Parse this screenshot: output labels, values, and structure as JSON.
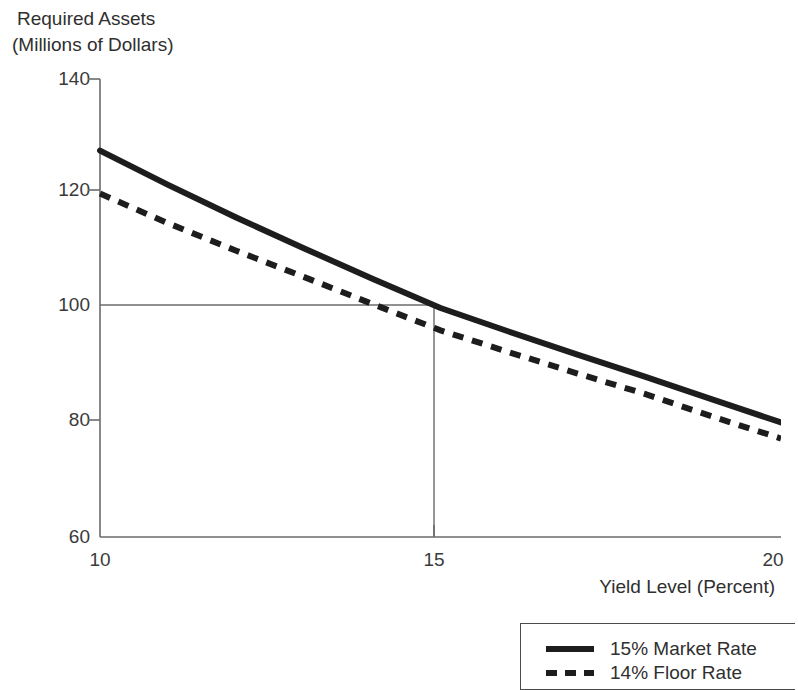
{
  "chart_data": {
    "type": "line",
    "title": "Required Assets (Millions of Dollars)",
    "title_line1": "Required Assets",
    "title_line2": "(Millions of Dollars)",
    "xlabel": "Yield Level (Percent)",
    "ylabel": "Required Assets (Millions of Dollars)",
    "xlim": [
      10,
      20
    ],
    "ylim": [
      60,
      140
    ],
    "xticks": [
      "10",
      "15",
      "20"
    ],
    "yticks": [
      "140",
      "120",
      "100",
      "80",
      "60"
    ],
    "grid": false,
    "legend_position": "bottom-right",
    "x": [
      10,
      11,
      12,
      13,
      14,
      15,
      16,
      17,
      18,
      19,
      20
    ],
    "series": [
      {
        "name": "15% Market Rate",
        "style": "solid",
        "color": "#1d1d1d",
        "values": [
          127.5,
          121.5,
          115.8,
          110.4,
          105.1,
          100.0,
          95.9,
          91.9,
          88.0,
          84.0,
          80.0
        ]
      },
      {
        "name": "14% Floor Rate",
        "style": "dashed",
        "color": "#1d1d1d",
        "values": [
          120.0,
          114.8,
          110.0,
          105.4,
          100.7,
          96.1,
          92.3,
          88.6,
          85.0,
          81.0,
          77.2
        ]
      }
    ],
    "reference_lines": [
      {
        "name": "assets-100-reference",
        "type": "horizontal",
        "value": 100,
        "from_x": 10,
        "to_x": 15
      },
      {
        "name": "yield-15-reference",
        "type": "vertical",
        "value": 15,
        "from_y": 60,
        "to_y": 100
      }
    ],
    "annotations": []
  },
  "legend": {
    "entries": [
      {
        "label": "15% Market Rate",
        "style": "solid"
      },
      {
        "label": "14% Floor Rate",
        "style": "dashed"
      }
    ]
  },
  "axis": {
    "y_tick_140": "140",
    "y_tick_120": "120",
    "y_tick_100": "100",
    "y_tick_80": "80",
    "y_tick_60": "60",
    "x_tick_10": "10",
    "x_tick_15": "15",
    "x_tick_20": "20"
  },
  "colors": {
    "line": "#1d1d1d",
    "axis": "#6b6b6b",
    "text": "#2f2f2f",
    "background": "#ffffff"
  }
}
